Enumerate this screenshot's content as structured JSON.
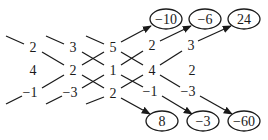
{
  "diagram": {
    "type": "sarrus-rule-determinant",
    "matrix": [
      [
        "2",
        "3",
        "5"
      ],
      [
        "4",
        "2",
        "1"
      ],
      [
        "−1",
        "−3",
        "2"
      ]
    ],
    "repeated_columns": [
      [
        "2",
        "3"
      ],
      [
        "4",
        "2"
      ],
      [
        "−1",
        "−3"
      ]
    ],
    "top_results": [
      "−10",
      "−6",
      "24"
    ],
    "bottom_results": [
      "8",
      "−3",
      "−60"
    ]
  }
}
